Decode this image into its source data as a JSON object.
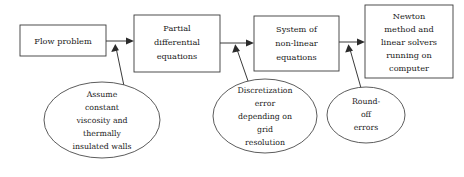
{
  "diagram": {
    "background_color": "#ffffff",
    "line_color": "#3a3a3a",
    "text_color": "#1a1a1a",
    "boxes": [
      {
        "id": "flow-problem",
        "lines": [
          "Flow problem"
        ],
        "x": 20,
        "y": 25,
        "w": 86,
        "h": 31
      },
      {
        "id": "partial-differential-equations",
        "lines": [
          "Partial",
          "differential",
          "equations"
        ],
        "x": 134,
        "y": 15,
        "w": 86,
        "h": 57
      },
      {
        "id": "system-of-non-linear-equations",
        "lines": [
          "System of",
          "non-linear",
          "equations"
        ],
        "x": 254,
        "y": 16,
        "w": 85,
        "h": 55
      },
      {
        "id": "newton-method-and-linear-solvers",
        "lines": [
          "Newton",
          "method and",
          "linear solvers",
          "running on",
          "computer"
        ],
        "x": 365,
        "y": 5,
        "w": 88,
        "h": 73
      }
    ],
    "ellipses": [
      {
        "id": "modelling-assumptions",
        "lines": [
          "Assume",
          "constant",
          "viscosity and",
          "thermally",
          "insulated walls"
        ],
        "cx": 102,
        "cy": 120,
        "rx": 58,
        "ry": 38
      },
      {
        "id": "discretization-error",
        "lines": [
          "Discretization",
          "error",
          "depending on",
          "grid",
          "resolution"
        ],
        "cx": 265,
        "cy": 116,
        "rx": 52,
        "ry": 37
      },
      {
        "id": "round-off-errors",
        "lines": [
          "Round-",
          "off",
          "errors"
        ],
        "cx": 366,
        "cy": 115,
        "rx": 39,
        "ry": 28
      }
    ],
    "connectors": [
      {
        "id": "flow-to-pde",
        "kind": "horizontal-arrow",
        "from": "flow-problem",
        "to": "partial-differential-equations"
      },
      {
        "id": "pde-to-system",
        "kind": "horizontal-arrow",
        "from": "partial-differential-equations",
        "to": "system-of-non-linear-equations"
      },
      {
        "id": "system-to-newton",
        "kind": "horizontal-arrow",
        "from": "system-of-non-linear-equations",
        "to": "newton-method-and-linear-solvers"
      },
      {
        "id": "assumptions-to-pde",
        "kind": "diagonal-arrow",
        "from": "modelling-assumptions",
        "to": "partial-differential-equations"
      },
      {
        "id": "discretization-to-system",
        "kind": "diagonal-arrow",
        "from": "discretization-error",
        "to": "system-of-non-linear-equations"
      },
      {
        "id": "roundoff-to-newton",
        "kind": "diagonal-arrow",
        "from": "round-off-errors",
        "to": "newton-method-and-linear-solvers"
      }
    ]
  }
}
